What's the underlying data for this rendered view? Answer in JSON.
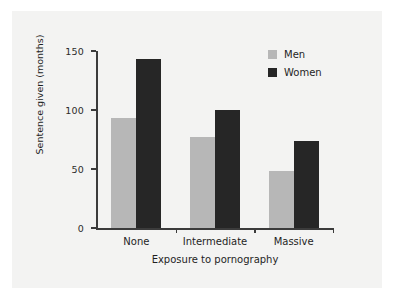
{
  "chart_data": {
    "type": "bar",
    "title": "",
    "subtitle": "",
    "xlabel": "Exposure to pornography",
    "ylabel": "Sentence given (months)",
    "categories": [
      "None",
      "Intermediate",
      "Massive"
    ],
    "series": [
      {
        "name": "Men",
        "color": "#b7b7b7",
        "values": [
          93,
          77,
          48
        ]
      },
      {
        "name": "Women",
        "color": "#262626",
        "values": [
          143,
          100,
          74
        ]
      }
    ],
    "ylim": [
      0,
      150
    ],
    "yticks": [
      0,
      50,
      100,
      150
    ],
    "ytick_labels": [
      "0",
      "50",
      "100",
      "150"
    ],
    "grid": false,
    "legend_position": "top-right",
    "legend_entries": [
      "Men",
      "Women"
    ],
    "axis_color": "#3b3b3b",
    "background_color": "#f3f3f2"
  }
}
